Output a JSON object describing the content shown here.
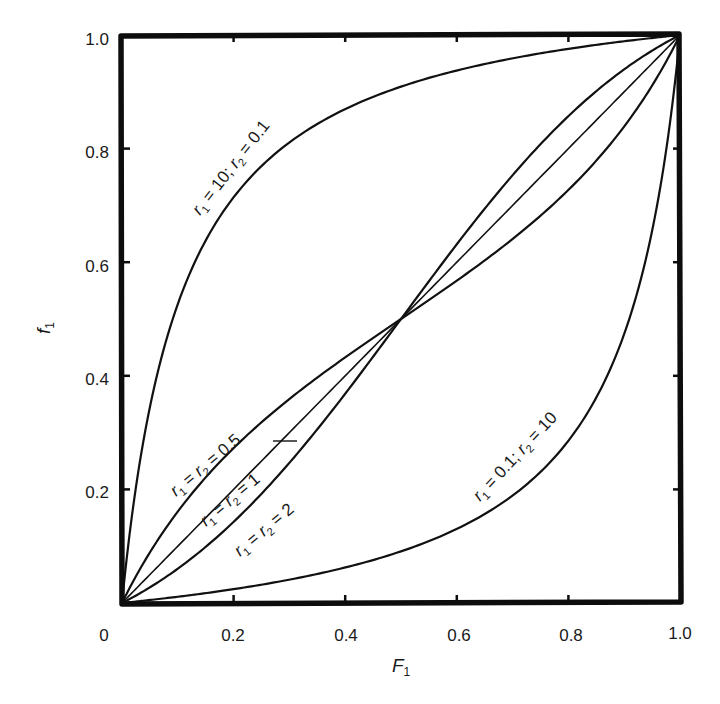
{
  "chart_data": {
    "type": "line",
    "title": "",
    "xlabel": "F1",
    "ylabel": "f1",
    "xlabel_display": {
      "main": "F",
      "sub": "1"
    },
    "ylabel_display": {
      "main": "f",
      "sub": "1"
    },
    "xlim": [
      0,
      1.0
    ],
    "ylim": [
      0,
      1.0
    ],
    "grid": false,
    "legend": "inline curve labels",
    "x_ticks": [
      "0",
      "0.2",
      "0.4",
      "0.6",
      "0.8",
      "1.0"
    ],
    "y_ticks": [
      "0.2",
      "0.4",
      "0.6",
      "0.8",
      "1.0"
    ],
    "x": [
      0,
      0.05,
      0.1,
      0.2,
      0.3,
      0.4,
      0.5,
      0.6,
      0.7,
      0.8,
      0.9,
      0.95,
      1.0
    ],
    "series": [
      {
        "name": "r1 = 10; r2 = 0.1",
        "label": {
          "r1": "10",
          "r2": "0.1",
          "form": "split"
        },
        "r1": 10,
        "r2": 0.1,
        "values": [
          0,
          0.345,
          0.526,
          0.714,
          0.811,
          0.87,
          0.909,
          0.938,
          0.959,
          0.976,
          0.989,
          0.995,
          1.0
        ]
      },
      {
        "name": "r1 = r2 = 0.5",
        "label": {
          "value": "0.5",
          "form": "equal"
        },
        "r1": 0.5,
        "r2": 0.5,
        "values": [
          0,
          0.09,
          0.161,
          0.273,
          0.359,
          0.432,
          0.5,
          0.568,
          0.641,
          0.727,
          0.839,
          0.91,
          1.0
        ]
      },
      {
        "name": "r1 = r2 = 1",
        "label": {
          "value": "1",
          "form": "equal"
        },
        "r1": 1,
        "r2": 1,
        "values": [
          0,
          0.05,
          0.1,
          0.2,
          0.3,
          0.4,
          0.5,
          0.6,
          0.7,
          0.8,
          0.9,
          0.95,
          1.0
        ]
      },
      {
        "name": "r1 = r2 = 2",
        "label": {
          "value": "2",
          "form": "equal"
        },
        "r1": 2,
        "r2": 2,
        "values": [
          0,
          0.027,
          0.06,
          0.143,
          0.247,
          0.368,
          0.5,
          0.632,
          0.753,
          0.857,
          0.94,
          0.973,
          1.0
        ]
      },
      {
        "name": "r1 = 0.1; r2 = 10",
        "label": {
          "r1": "0.1",
          "r2": "10",
          "form": "split"
        },
        "r1": 0.1,
        "r2": 10,
        "values": [
          0,
          0.005,
          0.011,
          0.024,
          0.041,
          0.062,
          0.091,
          0.13,
          0.189,
          0.286,
          0.474,
          0.655,
          1.0
        ]
      }
    ]
  },
  "labels": {
    "r": "r",
    "sub1": "1",
    "sub2": "2",
    "eq": " = ",
    "semi": "; "
  }
}
